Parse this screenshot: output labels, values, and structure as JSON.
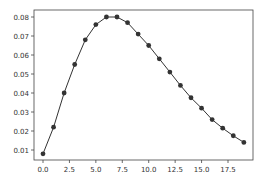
{
  "chart_data": {
    "type": "line",
    "title": "",
    "xlabel": "",
    "ylabel": "",
    "x": [
      0,
      1,
      2,
      3,
      4,
      5,
      6,
      7,
      8,
      9,
      10,
      11,
      12,
      13,
      14,
      15,
      16,
      17,
      18,
      19
    ],
    "series": [
      {
        "name": "",
        "color": "#333333",
        "marker": "circle",
        "values": [
          0.008,
          0.022,
          0.04,
          0.055,
          0.068,
          0.076,
          0.08,
          0.08,
          0.077,
          0.071,
          0.065,
          0.058,
          0.051,
          0.044,
          0.0375,
          0.032,
          0.026,
          0.0215,
          0.0175,
          0.014
        ]
      }
    ],
    "xlim": [
      -0.95,
      19.95
    ],
    "ylim": [
      0.0045,
      0.0835
    ],
    "xticks": [
      0.0,
      2.5,
      5.0,
      7.5,
      10.0,
      12.5,
      15.0,
      17.5
    ],
    "xtick_labels": [
      "0.0",
      "2.5",
      "5.0",
      "7.5",
      "10.0",
      "12.5",
      "15.0",
      "17.5"
    ],
    "yticks": [
      0.01,
      0.02,
      0.03,
      0.04,
      0.05,
      0.06,
      0.07,
      0.08
    ],
    "ytick_labels": [
      "0.01",
      "0.02",
      "0.03",
      "0.04",
      "0.05",
      "0.06",
      "0.07",
      "0.08"
    ],
    "grid": false,
    "legend": null
  }
}
